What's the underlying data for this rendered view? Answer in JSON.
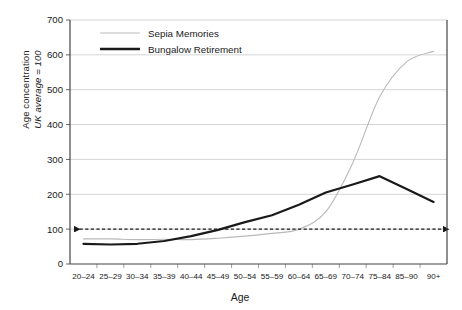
{
  "chart_data": {
    "type": "line",
    "title": "",
    "xlabel": "Age",
    "ylabel_line1": "Age concentration",
    "ylabel_line2": "UK average = 100",
    "categories": [
      "20–24",
      "25–29",
      "30–34",
      "35–39",
      "40–44",
      "45–49",
      "50–54",
      "55–59",
      "60–64",
      "65–69",
      "70–74",
      "75–84",
      "85–90",
      "90+"
    ],
    "ylim": [
      0,
      700
    ],
    "yticks": [
      0,
      100,
      200,
      300,
      400,
      500,
      600,
      700
    ],
    "grid": "horizontal",
    "legend_position": "top-left-inside",
    "series": [
      {
        "name": "Sepia Memories",
        "color": "#b9b9b9",
        "width": 1.1,
        "values": [
          72,
          72,
          70,
          71,
          70,
          74,
          80,
          88,
          100,
          150,
          290,
          480,
          580,
          610
        ]
      },
      {
        "name": "Bungalow Retirement",
        "color": "#1a1a1a",
        "width": 2.2,
        "values": [
          58,
          56,
          58,
          66,
          80,
          98,
          120,
          140,
          170,
          205,
          228,
          252,
          215,
          178
        ]
      }
    ],
    "annotations": [
      {
        "name": "uk-average-reference",
        "type": "double-arrow-dashed",
        "y_value": 100,
        "color": "#1a1a1a"
      }
    ]
  },
  "legend": {
    "items": [
      {
        "label": "Sepia Memories"
      },
      {
        "label": "Bungalow Retirement"
      }
    ]
  },
  "axes": {
    "y_tick_labels": [
      "0",
      "100",
      "200",
      "300",
      "400",
      "500",
      "600",
      "700"
    ],
    "x_tick_labels": [
      "20–24",
      "25–29",
      "30–34",
      "35–39",
      "40–44",
      "45–49",
      "50–54",
      "55–59",
      "60–64",
      "65–69",
      "70–74",
      "75–84",
      "85–90",
      "90+"
    ],
    "x_title": "Age",
    "y_title_line1": "Age concentration",
    "y_title_line2": "UK average = 100"
  }
}
